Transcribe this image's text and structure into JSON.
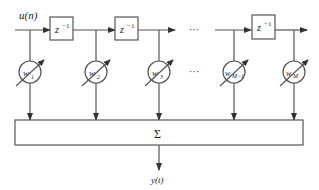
{
  "diagram": {
    "type": "transversal FIR adaptive filter (tapped delay line)",
    "input_label": "u(n)",
    "output_label": "y(t)",
    "delay_label": "z",
    "delay_exp": "−1",
    "sum_label": "Σ",
    "ellipsis": "···",
    "weights": [
      {
        "base": "w",
        "sub": "1"
      },
      {
        "base": "w",
        "sub": "2"
      },
      {
        "base": "w",
        "sub": "3"
      },
      {
        "base": "w",
        "sub": "M−1"
      },
      {
        "base": "w",
        "sub": "M"
      }
    ],
    "colors": {
      "stroke": "#555555",
      "text": "#222222",
      "background": "#ffffff"
    }
  }
}
